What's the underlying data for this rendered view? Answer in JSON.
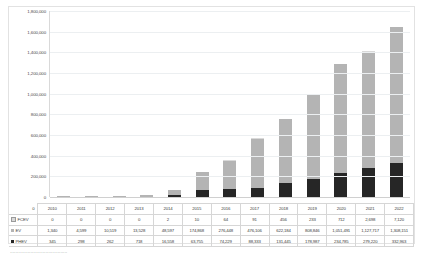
{
  "chart_data": {
    "type": "bar",
    "subtype": "stacked-column",
    "title": "",
    "xlabel": "",
    "ylabel": "",
    "ylim": [
      0,
      1800000
    ],
    "ytick_step": 200000,
    "grid": true,
    "legend_position": "table-row-headers",
    "categories": [
      "2010",
      "2011",
      "2012",
      "2013",
      "2014",
      "2015",
      "2016",
      "2017",
      "2018",
      "2019",
      "2020",
      "2021",
      "2022"
    ],
    "yticks": [
      "0",
      "200,000",
      "400,000",
      "600,000",
      "800,000",
      "1,000,000",
      "1,200,000",
      "1,400,000",
      "1,600,000",
      "1,800,000"
    ],
    "series": [
      {
        "name": "FCEV",
        "color": "#d9d9d9",
        "key": "key-fcev",
        "values": [
          0,
          0,
          0,
          0,
          2,
          10,
          64,
          91,
          456,
          233,
          712,
          2698,
          7120
        ],
        "labels": [
          "0",
          "0",
          "0",
          "0",
          "2",
          "10",
          "64",
          "91",
          "456",
          "233",
          "712",
          "2,698",
          "7,120"
        ]
      },
      {
        "name": "EV",
        "color": "#b4b4b4",
        "key": "key-ev",
        "values": [
          1340,
          4599,
          10519,
          13528,
          48597,
          174868,
          276448,
          476106,
          622184,
          808846,
          1051491,
          1127717,
          1308151
        ],
        "labels": [
          "1,340",
          "4,599",
          "10,519",
          "13,528",
          "48,597",
          "174,868",
          "276,448",
          "476,106",
          "622,184",
          "808,846",
          "1,051,491",
          "1,127,717",
          "1,308,151"
        ]
      },
      {
        "name": "PHEV",
        "color": "#262626",
        "key": "key-phev",
        "values": [
          345,
          298,
          262,
          718,
          16558,
          63755,
          74229,
          88333,
          131445,
          178987,
          234785,
          279220,
          332963
        ],
        "labels": [
          "345",
          "298",
          "262",
          "718",
          "16,558",
          "63,755",
          "74,229",
          "88,333",
          "131,445",
          "178,987",
          "234,785",
          "279,220",
          "332,963"
        ]
      }
    ]
  },
  "table": {
    "corner_label": "0",
    "year_header": [
      "2010",
      "2011",
      "2012",
      "2013",
      "2014",
      "2015",
      "2016",
      "2017",
      "2018",
      "2019",
      "2020",
      "2021",
      "2022"
    ]
  },
  "caption": {
    "text": "··········································"
  }
}
